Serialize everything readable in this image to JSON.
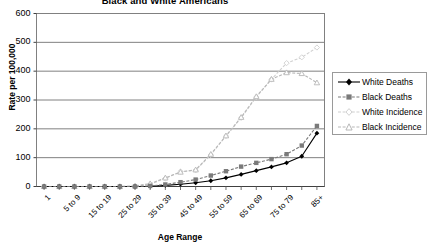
{
  "chart_data": {
    "type": "line",
    "title": "Black and White Americans",
    "xlabel": "Age Range",
    "ylabel": "Rate per 100,000",
    "ylim": [
      0,
      600
    ],
    "ytick_step": 100,
    "yticks": [
      0,
      100,
      200,
      300,
      400,
      500,
      600
    ],
    "grid": "horizontal",
    "legend_position": "right",
    "categories": [
      "1",
      "1 to 4",
      "5 to 9",
      "10 to 14",
      "15 to 19",
      "20 to 24",
      "25 to 29",
      "30 to 34",
      "35 to 39",
      "40 to 44",
      "45 to 49",
      "50 to 54",
      "55 to 59",
      "60 to 64",
      "65 to 69",
      "70 to 74",
      "75 to 79",
      "80 to 84",
      "85+"
    ],
    "xtick_labels_shown": [
      "1",
      "5 to 9",
      "15 to 19",
      "25 to 29",
      "35 to 39",
      "45 to 49",
      "55 to 59",
      "65 to 69",
      "75 to 79",
      "85+"
    ],
    "series": [
      {
        "name": "White Deaths",
        "color": "#000000",
        "marker": "diamond",
        "values": [
          0,
          0,
          0,
          0,
          0,
          0,
          0,
          1,
          4,
          8,
          13,
          20,
          30,
          42,
          55,
          68,
          82,
          105,
          185
        ]
      },
      {
        "name": "Black Deaths",
        "color": "#7a7a7a",
        "marker": "square",
        "values": [
          0,
          0,
          0,
          0,
          0,
          0,
          0,
          2,
          7,
          15,
          24,
          38,
          53,
          69,
          82,
          95,
          112,
          142,
          210
        ]
      },
      {
        "name": "White Incidence",
        "color": "#d0d0d0",
        "marker": "diamond-open",
        "values": [
          0,
          0,
          0,
          0,
          0,
          0,
          1,
          8,
          28,
          52,
          56,
          110,
          175,
          238,
          310,
          372,
          428,
          448,
          482
        ]
      },
      {
        "name": "Black Incidence",
        "color": "#b8b8b8",
        "marker": "triangle-open",
        "values": [
          0,
          0,
          0,
          0,
          0,
          0,
          2,
          10,
          30,
          50,
          58,
          112,
          176,
          240,
          312,
          372,
          395,
          392,
          360
        ]
      }
    ]
  },
  "legend": {
    "items": [
      {
        "label": "White Deaths"
      },
      {
        "label": "Black Deaths"
      },
      {
        "label": "White Incidence"
      },
      {
        "label": "Black Incidence"
      }
    ]
  }
}
